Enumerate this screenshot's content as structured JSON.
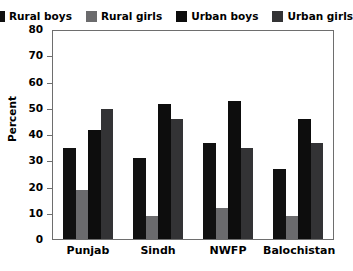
{
  "chart_data": {
    "type": "bar",
    "title": "",
    "xlabel": "",
    "ylabel": "Percent",
    "ylim": [
      0,
      80
    ],
    "yticks": [
      0,
      10,
      20,
      30,
      40,
      50,
      60,
      70,
      80
    ],
    "grid": false,
    "legend_position": "top",
    "categories": [
      "Punjab",
      "Sindh",
      "NWFP",
      "Balochistan"
    ],
    "series": [
      {
        "name": "Rural boys",
        "color": "#111111",
        "values": [
          35,
          31,
          37,
          27
        ]
      },
      {
        "name": "Rural girls",
        "color": "#6b6b6d",
        "values": [
          19,
          9,
          12,
          9
        ]
      },
      {
        "name": "Urban boys",
        "color": "#0d0d0d",
        "values": [
          42,
          52,
          53,
          46
        ]
      },
      {
        "name": "Urban girls",
        "color": "#333335",
        "values": [
          50,
          46,
          35,
          37
        ]
      }
    ]
  },
  "axis": {
    "frame_color": "#6e6e6e"
  }
}
